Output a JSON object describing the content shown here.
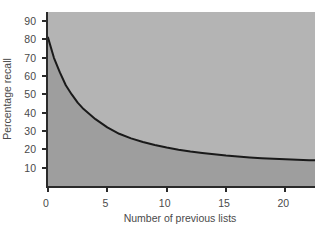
{
  "chart_data": {
    "type": "line",
    "title": "",
    "subtitle": "",
    "xlabel": "Number of previous lists",
    "ylabel": "Percentage recall",
    "xlim": [
      0,
      22.5
    ],
    "ylim": [
      0,
      95
    ],
    "x_ticks": [
      0,
      5,
      10,
      15,
      20
    ],
    "x_tick_labels": [
      "0",
      "5",
      "10",
      "15",
      "20"
    ],
    "y_ticks": [
      10,
      20,
      30,
      40,
      50,
      60,
      70,
      80,
      90
    ],
    "y_tick_labels": [
      "10",
      "20",
      "30",
      "40",
      "50",
      "60",
      "70",
      "80",
      "90"
    ],
    "grid": false,
    "legend": null,
    "annotations": [],
    "series": [
      {
        "name": "Percentage recall",
        "color": "#1a1a1a",
        "line_width": 2,
        "x": [
          0,
          0.5,
          1,
          1.5,
          2,
          2.5,
          3,
          4,
          5,
          6,
          7,
          8,
          9,
          10,
          11,
          12,
          13,
          14,
          15,
          16,
          17,
          18,
          19,
          20,
          21,
          22,
          22.5
        ],
        "values": [
          81,
          70,
          62,
          55,
          50,
          45.5,
          42,
          36.5,
          32,
          28.5,
          26,
          24,
          22.4,
          21,
          19.8,
          18.8,
          18,
          17.3,
          16.6,
          16.1,
          15.6,
          15.2,
          14.9,
          14.6,
          14.3,
          14.1,
          14.0
        ]
      }
    ],
    "fill_below_curve": {
      "enabled": true,
      "color": "#9e9e9e"
    },
    "plot_background": "#b4b4b4",
    "figure_background": "#ffffff",
    "axis_color": "#2a2a2a",
    "tick_label_color": "#4a4a4a"
  }
}
